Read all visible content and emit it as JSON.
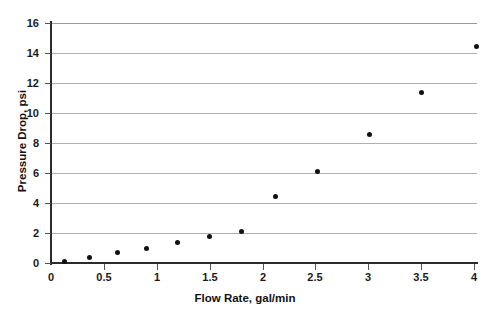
{
  "chart_data": {
    "type": "scatter",
    "title": "",
    "xlabel": "Flow Rate, gal/min",
    "ylabel": "Pressure Drop, psi",
    "xlim": [
      0,
      4
    ],
    "ylim": [
      0,
      16
    ],
    "xticks": [
      "0",
      "0.5",
      "1",
      "1.5",
      "2",
      "2.5",
      "3",
      "3.5",
      "4"
    ],
    "xtick_values": [
      0,
      0.5,
      1,
      1.5,
      2,
      2.5,
      3,
      3.5,
      4
    ],
    "yticks": [
      "0",
      "2",
      "4",
      "6",
      "8",
      "10",
      "12",
      "14",
      "16"
    ],
    "ytick_values": [
      0,
      2,
      4,
      6,
      8,
      10,
      12,
      14,
      16
    ],
    "grid": "horizontal",
    "legend": "none",
    "marker": "filled-diamond",
    "marker_color": "#111111",
    "grid_color": "#b0b0b0",
    "axis_color": "#2b2b2b",
    "background_color": "#ffffff",
    "x": [
      0.13,
      0.36,
      0.63,
      0.9,
      1.2,
      1.5,
      1.8,
      2.12,
      2.52,
      3.01,
      3.5,
      4.02
    ],
    "y": [
      0.1,
      0.4,
      0.7,
      1.0,
      1.35,
      1.75,
      2.1,
      4.45,
      6.1,
      8.55,
      11.35,
      14.45
    ],
    "points": [
      {
        "x": 0.13,
        "y": 0.1
      },
      {
        "x": 0.36,
        "y": 0.4
      },
      {
        "x": 0.63,
        "y": 0.7
      },
      {
        "x": 0.9,
        "y": 1.0
      },
      {
        "x": 1.2,
        "y": 1.35
      },
      {
        "x": 1.5,
        "y": 1.75
      },
      {
        "x": 1.8,
        "y": 2.1
      },
      {
        "x": 2.12,
        "y": 4.45
      },
      {
        "x": 2.52,
        "y": 6.1
      },
      {
        "x": 3.01,
        "y": 8.55
      },
      {
        "x": 3.5,
        "y": 11.35
      },
      {
        "x": 4.02,
        "y": 14.45
      }
    ]
  }
}
